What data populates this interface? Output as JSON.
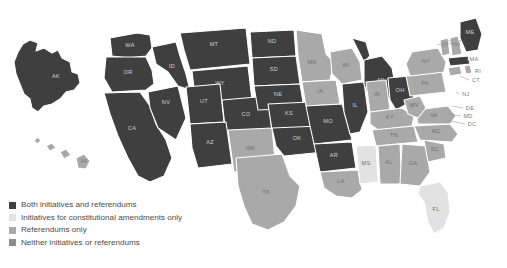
{
  "figure": {
    "type": "choropleth-map",
    "region": "United States"
  },
  "legend": {
    "items": [
      {
        "label": "Both initiatives and referendums",
        "color": "#3f3f3f",
        "key": "both"
      },
      {
        "label": "Initiatives for constitutional amendments only",
        "color": "#e2e2e2",
        "key": "init_const"
      },
      {
        "label": "Referendums only",
        "color": "#a9a9a9",
        "key": "ref_only"
      },
      {
        "label": "Neither initiatives or referendums",
        "color": "#8c8c8c",
        "key": "neither"
      }
    ]
  },
  "chart_data": {
    "type": "heatmap",
    "title": "",
    "categories": [
      "both",
      "init_const",
      "ref_only",
      "neither"
    ],
    "states": [
      {
        "code": "AK",
        "category": "both"
      },
      {
        "code": "HI",
        "category": "ref_only"
      },
      {
        "code": "WA",
        "category": "both"
      },
      {
        "code": "OR",
        "category": "both"
      },
      {
        "code": "CA",
        "category": "both"
      },
      {
        "code": "NV",
        "category": "both"
      },
      {
        "code": "ID",
        "category": "both"
      },
      {
        "code": "MT",
        "category": "both"
      },
      {
        "code": "WY",
        "category": "both"
      },
      {
        "code": "UT",
        "category": "both"
      },
      {
        "code": "AZ",
        "category": "both"
      },
      {
        "code": "CO",
        "category": "both"
      },
      {
        "code": "NM",
        "category": "ref_only"
      },
      {
        "code": "ND",
        "category": "both"
      },
      {
        "code": "SD",
        "category": "both"
      },
      {
        "code": "NE",
        "category": "both"
      },
      {
        "code": "KS",
        "category": "both"
      },
      {
        "code": "OK",
        "category": "both"
      },
      {
        "code": "TX",
        "category": "ref_only"
      },
      {
        "code": "MN",
        "category": "ref_only"
      },
      {
        "code": "IA",
        "category": "ref_only"
      },
      {
        "code": "MO",
        "category": "both"
      },
      {
        "code": "AR",
        "category": "both"
      },
      {
        "code": "LA",
        "category": "ref_only"
      },
      {
        "code": "WI",
        "category": "ref_only"
      },
      {
        "code": "IL",
        "category": "both"
      },
      {
        "code": "MI",
        "category": "both"
      },
      {
        "code": "IN",
        "category": "ref_only"
      },
      {
        "code": "OH",
        "category": "both"
      },
      {
        "code": "KY",
        "category": "ref_only"
      },
      {
        "code": "TN",
        "category": "ref_only"
      },
      {
        "code": "MS",
        "category": "init_const"
      },
      {
        "code": "AL",
        "category": "ref_only"
      },
      {
        "code": "GA",
        "category": "ref_only"
      },
      {
        "code": "FL",
        "category": "init_const"
      },
      {
        "code": "SC",
        "category": "ref_only"
      },
      {
        "code": "NC",
        "category": "ref_only"
      },
      {
        "code": "VA",
        "category": "ref_only"
      },
      {
        "code": "WV",
        "category": "ref_only"
      },
      {
        "code": "PA",
        "category": "ref_only"
      },
      {
        "code": "NY",
        "category": "ref_only"
      },
      {
        "code": "VT",
        "category": "ref_only"
      },
      {
        "code": "NH",
        "category": "ref_only"
      },
      {
        "code": "ME",
        "category": "both"
      },
      {
        "code": "MA",
        "category": "both"
      },
      {
        "code": "RI",
        "category": "ref_only"
      },
      {
        "code": "CT",
        "category": "ref_only"
      },
      {
        "code": "NJ",
        "category": "ref_only"
      },
      {
        "code": "DE",
        "category": "ref_only"
      },
      {
        "code": "MD",
        "category": "ref_only"
      },
      {
        "code": "DC",
        "category": "ref_only"
      }
    ],
    "labels": {
      "AK": "AK",
      "HI": "HI",
      "WA": "WA",
      "OR": "OR",
      "CA": "CA",
      "NV": "NV",
      "ID": "ID",
      "MT": "MT",
      "WY": "WY",
      "UT": "UT",
      "AZ": "AZ",
      "CO": "CO",
      "NM": "NM",
      "ND": "ND",
      "SD": "SD",
      "NE": "NE",
      "KS": "KS",
      "OK": "OK",
      "TX": "TX",
      "MN": "MN",
      "IA": "IA",
      "MO": "MO",
      "AR": "AR",
      "LA": "LA",
      "WI": "WI",
      "IL": "IL",
      "MI": "MI",
      "IN": "IN",
      "OH": "OH",
      "KY": "KY",
      "TN": "TN",
      "MS": "MS",
      "AL": "AL",
      "GA": "GA",
      "FL": "FL",
      "SC": "SC",
      "NC": "NC",
      "VA": "VA",
      "WV": "WV",
      "PA": "PA",
      "NY": "NY",
      "VT": "VT",
      "NH": "NH",
      "ME": "ME",
      "MA": "MA",
      "RI": "RI",
      "CT": "CT",
      "NJ": "NJ",
      "DE": "DE",
      "MD": "MD",
      "DC": "DC"
    }
  }
}
